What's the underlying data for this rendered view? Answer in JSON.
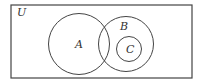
{
  "diagram": {
    "type": "venn",
    "stroke_color": "#444444",
    "background": "#ffffff",
    "universe": {
      "label": "U",
      "x": 11,
      "y": 5,
      "width": 181,
      "height": 73
    },
    "sets": [
      {
        "label": "A",
        "cx": 79,
        "cy": 44,
        "r": 30.5,
        "label_x": 75,
        "label_y": 48
      },
      {
        "label": "B",
        "cx": 126,
        "cy": 44,
        "r": 27.5,
        "label_x": 120,
        "label_y": 30
      },
      {
        "label": "C",
        "cx": 129,
        "cy": 49,
        "r": 12.5,
        "label_x": 126,
        "label_y": 53
      }
    ],
    "relations": [
      "C is a subset of B",
      "A and B overlap",
      "C does not intersect A"
    ]
  }
}
